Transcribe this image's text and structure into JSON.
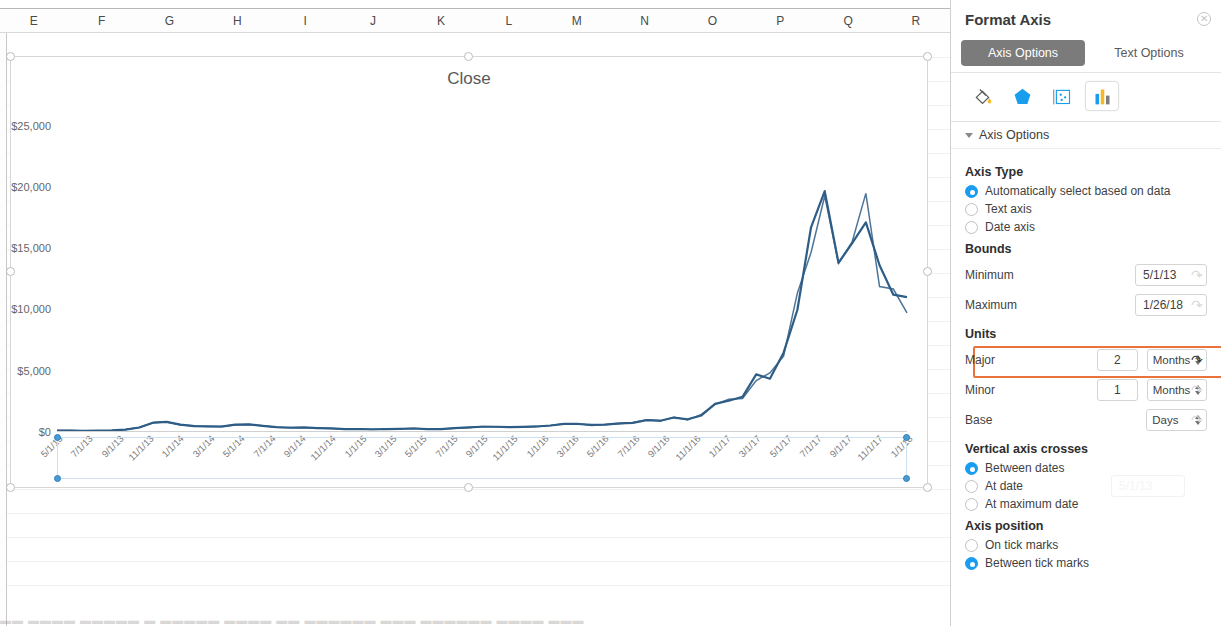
{
  "spreadsheet": {
    "column_headers": [
      "E",
      "F",
      "G",
      "H",
      "I",
      "J",
      "K",
      "L",
      "M",
      "N",
      "O",
      "P",
      "Q",
      "R"
    ],
    "bottom_cut_text": "▬▬ ▬▬▬▬ ▬▬▬▬▬ ▬ ▬▬▬▬▬ ▬▬▬▬ ▬▬ ▬▬▬▬▬▬ ▬▬▬ ▬▬▬▬▬▬ ▬▬▬▬ ▬▬▬"
  },
  "chart_data": {
    "type": "line",
    "title": "Close",
    "xlabel": "",
    "ylabel": "",
    "ylim": [
      0,
      27000
    ],
    "ytick_labels": [
      "$0",
      "$5,000",
      "$10,000",
      "$15,000",
      "$20,000",
      "$25,000"
    ],
    "ytick_values": [
      0,
      5000,
      10000,
      15000,
      20000,
      25000
    ],
    "grid": false,
    "legend": "none",
    "xlim": [
      "5/1/13",
      "1/26/18"
    ],
    "xtick_labels": [
      "5/1/13",
      "7/1/13",
      "9/1/13",
      "11/1/13",
      "1/1/14",
      "3/1/14",
      "5/1/14",
      "7/1/14",
      "9/1/14",
      "11/1/14",
      "1/1/15",
      "3/1/15",
      "5/1/15",
      "7/1/15",
      "9/1/15",
      "11/1/15",
      "1/1/16",
      "3/1/16",
      "5/1/16",
      "7/1/16",
      "9/1/16",
      "11/1/16",
      "1/1/17",
      "3/1/17",
      "5/1/17",
      "7/1/17",
      "9/1/17",
      "11/1/17",
      "1/1/18"
    ],
    "series": [
      {
        "name": "Close",
        "color": "#2e5d86",
        "x": [
          "5/1/13",
          "6/1/13",
          "7/1/13",
          "8/1/13",
          "9/1/13",
          "10/1/13",
          "11/1/13",
          "12/1/13",
          "1/1/14",
          "2/1/14",
          "3/1/14",
          "4/1/14",
          "5/1/14",
          "6/1/14",
          "7/1/14",
          "8/1/14",
          "9/1/14",
          "10/1/14",
          "11/1/14",
          "12/1/14",
          "1/1/15",
          "2/1/15",
          "3/1/15",
          "4/1/15",
          "5/1/15",
          "6/1/15",
          "7/1/15",
          "8/1/15",
          "9/1/15",
          "10/1/15",
          "11/1/15",
          "12/1/15",
          "1/1/16",
          "2/1/16",
          "3/1/16",
          "4/1/16",
          "5/1/16",
          "6/1/16",
          "7/1/16",
          "8/1/16",
          "9/1/16",
          "10/1/16",
          "11/1/16",
          "12/1/16",
          "1/1/17",
          "2/1/17",
          "3/1/17",
          "4/1/17",
          "5/1/17",
          "6/1/17",
          "7/1/17",
          "8/1/17",
          "9/1/17",
          "10/1/17",
          "11/1/17",
          "12/1/17",
          "12/17/17",
          "12/22/17",
          "12/28/17",
          "1/6/18",
          "1/12/18",
          "1/17/18",
          "1/26/18"
        ],
        "values": [
          120,
          110,
          90,
          105,
          130,
          200,
          370,
          760,
          830,
          600,
          480,
          450,
          445,
          600,
          620,
          500,
          400,
          345,
          370,
          320,
          290,
          240,
          245,
          225,
          235,
          250,
          285,
          240,
          235,
          310,
          370,
          430,
          430,
          400,
          420,
          450,
          530,
          670,
          650,
          575,
          605,
          700,
          745,
          960,
          920,
          1180,
          1040,
          1350,
          2290,
          2550,
          2870,
          4700,
          4350,
          6470,
          9950,
          16700,
          19650,
          13800,
          15400,
          17100,
          13600,
          11200,
          11000
        ]
      }
    ],
    "peak_value": 19650,
    "peak_label": "12/17/17"
  },
  "format_pane": {
    "title": "Format Axis",
    "close_label": "✕",
    "tabs": [
      {
        "label": "Axis Options",
        "active": true
      },
      {
        "label": "Text Options",
        "active": false
      }
    ],
    "icon_buttons": [
      {
        "name": "fill-bucket-icon",
        "selected": false
      },
      {
        "name": "effects-pentagon-icon",
        "selected": false
      },
      {
        "name": "size-properties-icon",
        "selected": false
      },
      {
        "name": "axis-options-chart-icon",
        "selected": true
      }
    ],
    "section_toggle": "Axis Options",
    "axis_type": {
      "title": "Axis Type",
      "options": [
        {
          "label": "Automatically select based on data",
          "selected": true
        },
        {
          "label": "Text axis",
          "selected": false
        },
        {
          "label": "Date axis",
          "selected": false
        }
      ]
    },
    "bounds": {
      "title": "Bounds",
      "minimum": {
        "label": "Minimum",
        "value": "5/1/13"
      },
      "maximum": {
        "label": "Maximum",
        "value": "1/26/18"
      }
    },
    "units": {
      "title": "Units",
      "highlighted_row": "Major",
      "major": {
        "label": "Major",
        "value": "2",
        "unit": "Months"
      },
      "minor": {
        "label": "Minor",
        "value": "1",
        "unit": "Months"
      },
      "base": {
        "label": "Base",
        "value": "",
        "unit": "Days"
      }
    },
    "vertical_axis_crosses": {
      "title": "Vertical axis crosses",
      "options": [
        {
          "label": "Between dates",
          "selected": true
        },
        {
          "label": "At date",
          "selected": false,
          "field_value": "5/1/13"
        },
        {
          "label": "At maximum date",
          "selected": false
        }
      ]
    },
    "axis_position": {
      "title": "Axis position",
      "options": [
        {
          "label": "On tick marks",
          "selected": false
        },
        {
          "label": "Between tick marks",
          "selected": true
        }
      ]
    },
    "colors": {
      "accent_blue": "#1a9cf0",
      "highlight_orange": "#e8733f",
      "tab_active_bg": "#7b7b7b",
      "series_blue": "#2e5d86"
    }
  }
}
